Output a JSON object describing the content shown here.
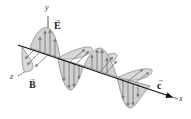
{
  "diagram": {
    "axes": {
      "x_label": "x",
      "y_label": "y",
      "z_label": "z"
    },
    "vectors": {
      "electric_field": {
        "symbol": "E",
        "arrow": "→"
      },
      "magnetic_field": {
        "symbol": "B",
        "arrow": "→"
      },
      "velocity": {
        "symbol": "c",
        "arrow": "→"
      }
    },
    "colors": {
      "lobe_fill": "#d4d4d4",
      "lobe_stroke": "#8a8a8a",
      "arrow": "#7a7a7a",
      "axis": "#1a1a1a"
    }
  }
}
